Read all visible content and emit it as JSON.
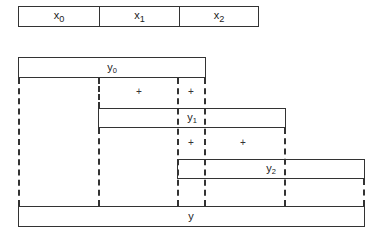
{
  "diagram": {
    "type": "parallel-prefix-sum",
    "inputs": {
      "cells": [
        {
          "base": "x",
          "sub": "0"
        },
        {
          "base": "x",
          "sub": "1"
        },
        {
          "base": "x",
          "sub": "2"
        }
      ]
    },
    "partials": [
      {
        "base": "y",
        "sub": "0"
      },
      {
        "base": "y",
        "sub": "1"
      },
      {
        "base": "y",
        "sub": "2"
      }
    ],
    "output": {
      "base": "y",
      "sub": ""
    },
    "operator_symbol": "+",
    "colors": {
      "line": "#333333",
      "text": "#222222",
      "background": "#ffffff"
    }
  }
}
